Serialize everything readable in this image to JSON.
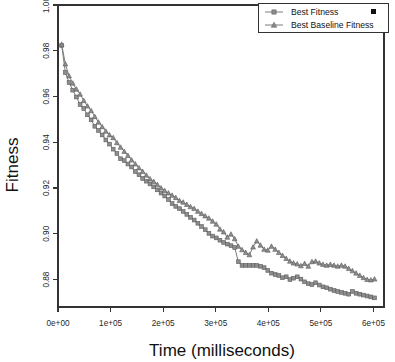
{
  "chart_data": {
    "type": "line",
    "title": "",
    "xlabel": "Time (milliseconds)",
    "ylabel": "Fitness",
    "xlim": [
      0,
      620000
    ],
    "ylim": [
      0.868,
      1.0
    ],
    "grid": false,
    "legend_position": "top-right",
    "xticks": [
      0,
      100000,
      200000,
      300000,
      400000,
      500000,
      600000
    ],
    "xticklabels": [
      "0e+00",
      "1e+05",
      "2e+05",
      "3e+05",
      "4e+05",
      "5e+05",
      "6e+05"
    ],
    "yticks": [
      1.0,
      0.98,
      0.96,
      0.94,
      0.92,
      0.9,
      0.88
    ],
    "yticklabels": [
      "1.00",
      "0.98",
      "0.96",
      "0.94",
      "0.92",
      "0.90",
      "0.88"
    ],
    "series": [
      {
        "name": "Best Fitness",
        "marker": "square",
        "color": "#8d8d8d",
        "x": [
          7000,
          14000,
          21000,
          28000,
          35000,
          42000,
          49000,
          56000,
          63000,
          70000,
          77000,
          84000,
          91000,
          98000,
          105000,
          112000,
          119000,
          126000,
          133000,
          140000,
          147000,
          154000,
          161000,
          168000,
          175000,
          182000,
          189000,
          196000,
          203000,
          210000,
          217000,
          224000,
          231000,
          238000,
          245000,
          252000,
          259000,
          266000,
          273000,
          280000,
          287000,
          294000,
          301000,
          308000,
          315000,
          322000,
          329000,
          336000,
          343000,
          350000,
          357000,
          364000,
          371000,
          378000,
          385000,
          392000,
          399000,
          406000,
          413000,
          420000,
          427000,
          434000,
          441000,
          448000,
          455000,
          462000,
          469000,
          476000,
          483000,
          490000,
          497000,
          504000,
          511000,
          518000,
          525000,
          532000,
          539000,
          546000,
          553000,
          560000,
          567000,
          574000,
          581000,
          588000,
          595000,
          602000
        ],
        "y": [
          0.9823,
          0.9705,
          0.9661,
          0.9628,
          0.9598,
          0.9565,
          0.9548,
          0.952,
          0.9498,
          0.947,
          0.9452,
          0.9432,
          0.941,
          0.9392,
          0.937,
          0.9351,
          0.9328,
          0.932,
          0.9305,
          0.9292,
          0.9272,
          0.9258,
          0.9242,
          0.923,
          0.9218,
          0.9205,
          0.9192,
          0.9178,
          0.9165,
          0.915,
          0.9132,
          0.912,
          0.911,
          0.9098,
          0.9085,
          0.9072,
          0.906,
          0.9046,
          0.9032,
          0.9018,
          0.9002,
          0.899,
          0.8982,
          0.8972,
          0.8962,
          0.8955,
          0.8948,
          0.894,
          0.8878,
          0.8862,
          0.8862,
          0.8862,
          0.8862,
          0.8862,
          0.8858,
          0.8852,
          0.884,
          0.8828,
          0.8822,
          0.8818,
          0.8808,
          0.8812,
          0.88,
          0.8806,
          0.8812,
          0.8802,
          0.879,
          0.8782,
          0.8778,
          0.8786,
          0.8776,
          0.8768,
          0.8764,
          0.8758,
          0.8752,
          0.8748,
          0.8744,
          0.874,
          0.8736,
          0.8748,
          0.874,
          0.8736,
          0.8732,
          0.8728,
          0.8724,
          0.872
        ]
      },
      {
        "name": "Best Baseline Fitness",
        "marker": "triangle",
        "color": "#8d8d8d",
        "x": [
          7000,
          14000,
          21000,
          28000,
          35000,
          42000,
          49000,
          56000,
          63000,
          70000,
          77000,
          84000,
          91000,
          98000,
          105000,
          112000,
          119000,
          126000,
          133000,
          140000,
          147000,
          154000,
          161000,
          168000,
          175000,
          182000,
          189000,
          196000,
          203000,
          210000,
          217000,
          224000,
          231000,
          238000,
          245000,
          252000,
          259000,
          266000,
          273000,
          280000,
          287000,
          294000,
          301000,
          308000,
          315000,
          322000,
          329000,
          336000,
          343000,
          350000,
          357000,
          364000,
          371000,
          378000,
          385000,
          392000,
          399000,
          406000,
          413000,
          420000,
          427000,
          434000,
          441000,
          448000,
          455000,
          462000,
          469000,
          476000,
          483000,
          490000,
          497000,
          504000,
          511000,
          518000,
          525000,
          532000,
          539000,
          546000,
          553000,
          560000,
          567000,
          574000,
          581000,
          588000,
          595000,
          602000
        ],
        "y": [
          0.9828,
          0.9742,
          0.969,
          0.9658,
          0.9632,
          0.961,
          0.9582,
          0.9558,
          0.9538,
          0.9512,
          0.9488,
          0.9468,
          0.9448,
          0.9432,
          0.942,
          0.9398,
          0.9378,
          0.936,
          0.9342,
          0.9322,
          0.9305,
          0.9288,
          0.9272,
          0.9256,
          0.924,
          0.9228,
          0.9215,
          0.92,
          0.9188,
          0.9178,
          0.9168,
          0.9158,
          0.9145,
          0.9138,
          0.9128,
          0.9118,
          0.911,
          0.9098,
          0.9088,
          0.9078,
          0.9068,
          0.9055,
          0.9042,
          0.902,
          0.9008,
          0.8985,
          0.8998,
          0.8978,
          0.8945,
          0.893,
          0.8918,
          0.8908,
          0.8942,
          0.8968,
          0.895,
          0.8932,
          0.8928,
          0.8945,
          0.8932,
          0.8918,
          0.8905,
          0.8892,
          0.888,
          0.8872,
          0.8868,
          0.886,
          0.887,
          0.8858,
          0.8878,
          0.888,
          0.8872,
          0.8866,
          0.8862,
          0.8866,
          0.8862,
          0.8858,
          0.8862,
          0.8858,
          0.8848,
          0.8838,
          0.8828,
          0.8818,
          0.8808,
          0.88,
          0.8798,
          0.8802
        ]
      }
    ]
  },
  "legend": {
    "entries": [
      {
        "label": "Best Fitness",
        "marker": "square"
      },
      {
        "label": "Best Baseline Fitness",
        "marker": "triangle"
      }
    ]
  },
  "artifact": {
    "name": "black-square-mark"
  }
}
